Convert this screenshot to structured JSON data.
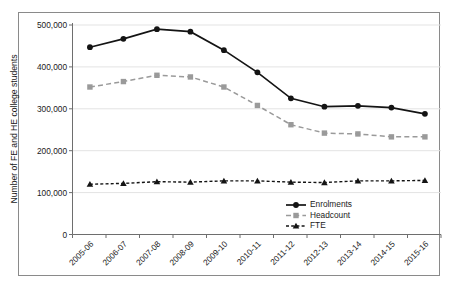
{
  "chart_data": {
    "type": "line",
    "title": "",
    "xlabel": "",
    "ylabel": "Number of FE and HE college students",
    "ylim": [
      0,
      500000
    ],
    "ytick_labels": [
      "0",
      "100,000",
      "200,000",
      "300,000",
      "400,000",
      "500,000"
    ],
    "ytick_values": [
      0,
      100000,
      200000,
      300000,
      400000,
      500000
    ],
    "grid": true,
    "legend_position": "inside bottom-right",
    "categories": [
      "2005-06",
      "2006-07",
      "2007-08",
      "2008-09",
      "2009-10",
      "2010-11",
      "2011-12",
      "2012-13",
      "2013-14",
      "2014-15",
      "2015-16"
    ],
    "series": [
      {
        "name": "Enrolments",
        "marker": "circle",
        "line_style": "solid",
        "color": "#141414",
        "values": [
          447000,
          467000,
          490000,
          484000,
          440000,
          387000,
          325000,
          305000,
          307000,
          303000,
          288000
        ]
      },
      {
        "name": "Headcount",
        "marker": "square",
        "line_style": "dashed",
        "color": "#9a9a9a",
        "values": [
          352000,
          365000,
          380000,
          376000,
          352000,
          308000,
          262000,
          242000,
          240000,
          233000,
          233000
        ]
      },
      {
        "name": "FTE",
        "marker": "triangle",
        "line_style": "dotted",
        "color": "#141414",
        "values": [
          120000,
          122000,
          126000,
          125000,
          128000,
          128000,
          125000,
          124000,
          128000,
          128000,
          129000
        ]
      }
    ]
  },
  "legend": {
    "items": [
      {
        "label": "Enrolments"
      },
      {
        "label": "Headcount"
      },
      {
        "label": "FTE"
      }
    ]
  },
  "colors": {
    "enrolments": "#141414",
    "headcount": "#9a9a9a",
    "fte": "#141414",
    "axis": "#6e6e6e",
    "grid": "#e3e3e3",
    "frame": "#8a8a8a",
    "background": "#ffffff"
  }
}
